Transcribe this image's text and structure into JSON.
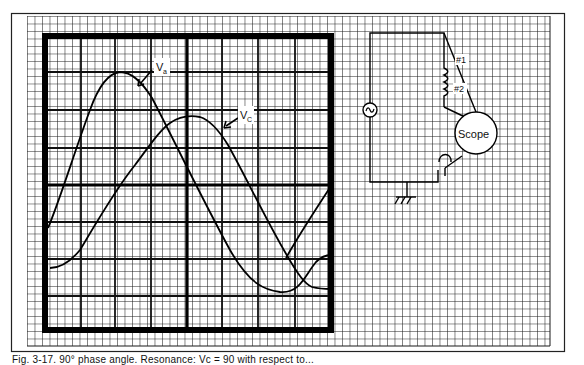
{
  "figure": {
    "caption": "Fig. 3-17. 90° phase angle. Resonance: Vc = 90 with respect to...",
    "colors": {
      "ink": "#111111",
      "paper": "#ffffff",
      "grid": "#222222"
    }
  },
  "scope": {
    "traces": [
      {
        "label_main": "V",
        "label_sub": "a",
        "name": "Va"
      },
      {
        "label_main": "V",
        "label_sub": "C",
        "name": "Vc"
      }
    ]
  },
  "circuit": {
    "source_symbol": "~",
    "lead_1": "#1",
    "lead_2": "#2",
    "scope_label": "Scope"
  }
}
